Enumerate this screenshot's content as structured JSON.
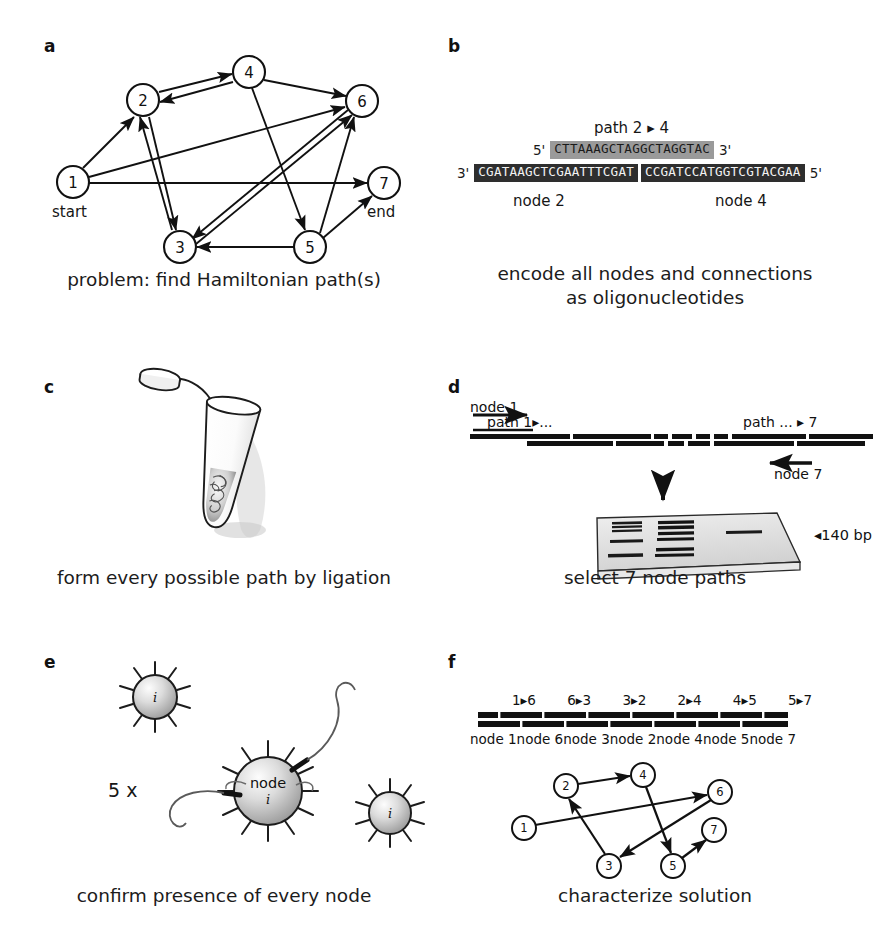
{
  "figure": {
    "background": "#ffffff",
    "ink": "#111111"
  },
  "panels": {
    "a": {
      "label": "a",
      "caption": "problem: find Hamiltonian path(s)",
      "nodes": [
        {
          "id": "1",
          "x": 73,
          "y": 182,
          "sub": "start"
        },
        {
          "id": "2",
          "x": 143,
          "y": 100,
          "sub": ""
        },
        {
          "id": "3",
          "x": 180,
          "y": 247,
          "sub": ""
        },
        {
          "id": "4",
          "x": 249,
          "y": 72,
          "sub": ""
        },
        {
          "id": "5",
          "x": 310,
          "y": 247,
          "sub": ""
        },
        {
          "id": "6",
          "x": 362,
          "y": 101,
          "sub": ""
        },
        {
          "id": "7",
          "x": 384,
          "y": 183,
          "sub": "end"
        }
      ],
      "node_radius": 16,
      "edges": [
        {
          "from": "1",
          "to": "2"
        },
        {
          "from": "1",
          "to": "6"
        },
        {
          "from": "1",
          "to": "7"
        },
        {
          "from": "2",
          "to": "3"
        },
        {
          "from": "2",
          "to": "4"
        },
        {
          "from": "3",
          "to": "2"
        },
        {
          "from": "3",
          "to": "6"
        },
        {
          "from": "4",
          "to": "2"
        },
        {
          "from": "4",
          "to": "5"
        },
        {
          "from": "4",
          "to": "6"
        },
        {
          "from": "5",
          "to": "3"
        },
        {
          "from": "5",
          "to": "6"
        },
        {
          "from": "5",
          "to": "7"
        },
        {
          "from": "6",
          "to": "3"
        }
      ],
      "start_label": "start",
      "end_label": "end"
    },
    "b": {
      "label": "b",
      "caption": "encode all nodes and connections\nas oligonucleotides",
      "path_label": "path 2 ▸ 4",
      "top_strand": {
        "five_prime": "5'",
        "three_prime": "3'",
        "sequence": "CTTAAAGCTAGGCTAGGTAC"
      },
      "bottom_strand": {
        "three_prime": "3'",
        "five_prime": "5'",
        "block_1": "CGATAAGCTCGAATTTCGAT",
        "block_2": "CCGATCCATGGTCGTACGAA"
      },
      "node_labels": [
        "node 2",
        "node 4"
      ]
    },
    "c": {
      "label": "c",
      "caption": "form every possible path by ligation",
      "icon": "microcentrifuge-tube"
    },
    "d": {
      "label": "d",
      "caption": "select 7 node paths",
      "primer_top_label": "node 1",
      "primer_bottom_label": "node 7",
      "path_start_label": "path 1▸...",
      "path_end_label": "path ... ▸ 7",
      "gel_marker": "◂140 bp",
      "gel_icon": "agarose-gel"
    },
    "e": {
      "label": "e",
      "caption": "confirm presence of every node",
      "multiplier": "5 x",
      "bead_small_label": "i",
      "bead_main_label_1": "node",
      "bead_main_label_2": "i",
      "beads": [
        {
          "id": "bead-top-left",
          "cx": 155,
          "cy": 697,
          "r": 22,
          "label": "i",
          "spikes": 10
        },
        {
          "id": "bead-center",
          "cx": 268,
          "cy": 791,
          "r": 34,
          "label": "node",
          "spikes": 12
        },
        {
          "id": "bead-right",
          "cx": 390,
          "cy": 813,
          "r": 21,
          "label": "i",
          "spikes": 10
        }
      ]
    },
    "f": {
      "label": "f",
      "caption": "characterize solution",
      "path_segments": [
        "1▸6",
        "6▸3",
        "3▸2",
        "2▸4",
        "4▸5",
        "5▸7"
      ],
      "node_segments": [
        "node 1",
        "node 6",
        "node 3",
        "node 2",
        "node 4",
        "node 5",
        "node 7"
      ],
      "solution_order": [
        "1",
        "6",
        "3",
        "2",
        "4",
        "5",
        "7"
      ],
      "nodes": [
        {
          "id": "1",
          "x": 524,
          "y": 828
        },
        {
          "id": "2",
          "x": 566,
          "y": 786
        },
        {
          "id": "3",
          "x": 609,
          "y": 866
        },
        {
          "id": "4",
          "x": 643,
          "y": 775
        },
        {
          "id": "5",
          "x": 673,
          "y": 866
        },
        {
          "id": "6",
          "x": 720,
          "y": 792
        },
        {
          "id": "7",
          "x": 714,
          "y": 830
        }
      ],
      "node_radius": 12,
      "edges": [
        {
          "from": "1",
          "to": "6"
        },
        {
          "from": "6",
          "to": "3"
        },
        {
          "from": "3",
          "to": "2"
        },
        {
          "from": "2",
          "to": "4"
        },
        {
          "from": "4",
          "to": "5"
        },
        {
          "from": "5",
          "to": "7"
        }
      ]
    }
  }
}
